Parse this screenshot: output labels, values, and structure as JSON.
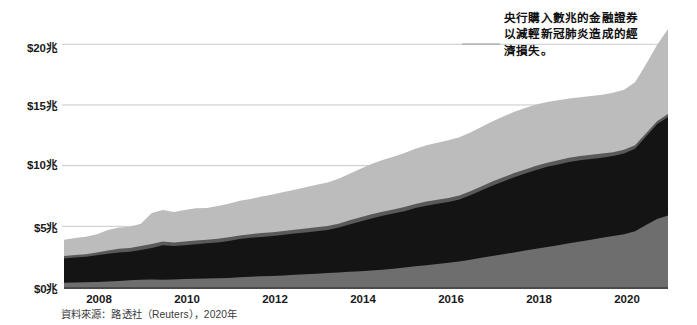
{
  "chart_data": {
    "type": "area",
    "stacked": true,
    "title": "",
    "xlabel": "",
    "ylabel": "",
    "ylim": [
      0,
      22
    ],
    "xlim": [
      2007.0,
      2020.75
    ],
    "grid": true,
    "grid_axis": "y",
    "y_ticks": [
      0,
      5,
      10,
      15,
      20
    ],
    "y_tick_labels": [
      "$0兆",
      "$5兆",
      "$10兆",
      "$15兆",
      "$20兆"
    ],
    "x_ticks": [
      2008,
      2010,
      2012,
      2014,
      2016,
      2018,
      2020
    ],
    "x_tick_labels": [
      "2008",
      "2010",
      "2012",
      "2014",
      "2016",
      "2018",
      "2020"
    ],
    "legend": "none",
    "colors": {
      "band_bottom": "#6e6e6e",
      "band_black": "#141414",
      "band_darkgray": "#595959",
      "band_lightgray": "#bcbcbc",
      "gridline": "#c9c9c9",
      "axis": "#4a4a4a"
    },
    "x": [
      2007.0,
      2007.25,
      2007.5,
      2007.75,
      2008.0,
      2008.25,
      2008.5,
      2008.75,
      2009.0,
      2009.25,
      2009.5,
      2009.75,
      2010.0,
      2010.25,
      2010.5,
      2010.75,
      2011.0,
      2011.25,
      2011.5,
      2011.75,
      2012.0,
      2012.25,
      2012.5,
      2012.75,
      2013.0,
      2013.25,
      2013.5,
      2013.75,
      2014.0,
      2014.25,
      2014.5,
      2014.75,
      2015.0,
      2015.25,
      2015.5,
      2015.75,
      2016.0,
      2016.25,
      2016.5,
      2016.75,
      2017.0,
      2017.25,
      2017.5,
      2017.75,
      2018.0,
      2018.25,
      2018.5,
      2018.75,
      2019.0,
      2019.25,
      2019.5,
      2019.75,
      2020.0,
      2020.25,
      2020.5,
      2020.75
    ],
    "series": [
      {
        "name": "band-bottom",
        "color": "#6e6e6e",
        "values": [
          0.35,
          0.38,
          0.4,
          0.42,
          0.45,
          0.5,
          0.55,
          0.6,
          0.62,
          0.6,
          0.62,
          0.65,
          0.68,
          0.7,
          0.72,
          0.75,
          0.8,
          0.85,
          0.88,
          0.9,
          0.95,
          1.0,
          1.05,
          1.1,
          1.15,
          1.2,
          1.25,
          1.3,
          1.35,
          1.42,
          1.5,
          1.6,
          1.7,
          1.8,
          1.9,
          2.0,
          2.1,
          2.25,
          2.4,
          2.55,
          2.7,
          2.85,
          3.0,
          3.15,
          3.3,
          3.45,
          3.6,
          3.75,
          3.9,
          4.05,
          4.2,
          4.35,
          4.6,
          5.1,
          5.6,
          5.9
        ]
      },
      {
        "name": "band-black",
        "color": "#141414",
        "values": [
          2.0,
          2.05,
          2.1,
          2.2,
          2.3,
          2.35,
          2.35,
          2.45,
          2.6,
          2.85,
          2.75,
          2.8,
          2.85,
          2.9,
          2.95,
          3.05,
          3.15,
          3.2,
          3.25,
          3.3,
          3.35,
          3.4,
          3.45,
          3.5,
          3.55,
          3.7,
          3.9,
          4.1,
          4.3,
          4.45,
          4.55,
          4.65,
          4.8,
          4.9,
          4.95,
          5.0,
          5.1,
          5.3,
          5.55,
          5.8,
          6.0,
          6.2,
          6.35,
          6.5,
          6.6,
          6.65,
          6.7,
          6.7,
          6.65,
          6.6,
          6.6,
          6.65,
          6.8,
          7.3,
          7.8,
          8.1
        ]
      },
      {
        "name": "band-darkgray",
        "color": "#595959",
        "values": [
          0.2,
          0.2,
          0.2,
          0.22,
          0.25,
          0.3,
          0.32,
          0.32,
          0.32,
          0.3,
          0.3,
          0.3,
          0.3,
          0.3,
          0.3,
          0.3,
          0.3,
          0.3,
          0.32,
          0.32,
          0.32,
          0.32,
          0.32,
          0.32,
          0.32,
          0.32,
          0.34,
          0.34,
          0.34,
          0.34,
          0.34,
          0.34,
          0.34,
          0.34,
          0.34,
          0.34,
          0.34,
          0.34,
          0.34,
          0.34,
          0.34,
          0.34,
          0.34,
          0.34,
          0.34,
          0.34,
          0.34,
          0.34,
          0.34,
          0.34,
          0.3,
          0.3,
          0.28,
          0.26,
          0.25,
          0.25
        ]
      },
      {
        "name": "band-lightgray",
        "color": "#bcbcbc",
        "values": [
          1.35,
          1.4,
          1.45,
          1.5,
          1.7,
          1.75,
          1.75,
          1.85,
          2.55,
          2.6,
          2.5,
          2.6,
          2.65,
          2.6,
          2.7,
          2.75,
          2.85,
          2.9,
          3.0,
          3.1,
          3.2,
          3.3,
          3.4,
          3.5,
          3.6,
          3.7,
          3.85,
          4.0,
          4.15,
          4.25,
          4.35,
          4.45,
          4.55,
          4.65,
          4.7,
          4.75,
          4.8,
          4.85,
          4.9,
          4.95,
          5.0,
          5.05,
          5.05,
          5.05,
          5.0,
          4.95,
          4.9,
          4.85,
          4.85,
          4.85,
          4.9,
          4.95,
          5.2,
          5.7,
          6.3,
          7.0
        ]
      }
    ],
    "annotation": {
      "lines": [
        "央行購入數兆的金融證券",
        "以減輕新冠肺炎造成的經",
        "濟損失。"
      ],
      "text": "央行購入數兆的金融證券以減輕新冠肺炎造成的經濟損失。",
      "leader_line": true
    },
    "source_note": "資料來源：路透社（Reuters），2020年"
  },
  "axis": {
    "y_labels": [
      {
        "text": "$20兆",
        "top": 39,
        "left": 27
      },
      {
        "text": "$15兆",
        "top": 97,
        "left": 27
      },
      {
        "text": "$10兆",
        "top": 156,
        "left": 27
      },
      {
        "text": "$5兆",
        "top": 219,
        "left": 34
      },
      {
        "text": "$0兆",
        "top": 280,
        "left": 34
      }
    ],
    "x_labels": [
      {
        "text": "2008",
        "left": 99
      },
      {
        "text": "2010",
        "left": 187
      },
      {
        "text": "2012",
        "left": 275
      },
      {
        "text": "2014",
        "left": 363
      },
      {
        "text": "2016",
        "left": 451
      },
      {
        "text": "2018",
        "left": 539
      },
      {
        "text": "2020",
        "left": 627
      }
    ]
  },
  "source": {
    "text": "資料來源：路透社（Reuters），2020年"
  }
}
